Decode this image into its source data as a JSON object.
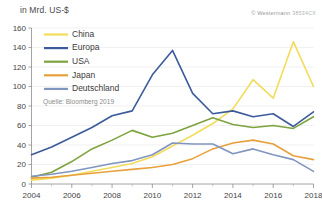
{
  "chart_data": {
    "type": "line",
    "title": "",
    "ylabel": "in Mrd. US-$",
    "xlabel": "",
    "unit_label": "in Mrd. US-$",
    "source": "Quelle: Bloomberg 2019",
    "copyright": "© Westermann",
    "copyright_code": "38534CX",
    "grid": true,
    "legend_position": "top-left",
    "ylim": [
      0,
      160
    ],
    "xlim": [
      2004,
      2018
    ],
    "yticks": [
      0,
      20,
      40,
      60,
      80,
      100,
      120,
      140,
      160
    ],
    "ytick_labels": [
      "0",
      "20",
      "40",
      "60",
      "80",
      "100",
      "120",
      "140",
      "160"
    ],
    "xticks": [
      2004,
      2006,
      2008,
      2010,
      2012,
      2014,
      2016,
      2018
    ],
    "xtick_labels": [
      "2004",
      "2006",
      "2008",
      "2010",
      "2012",
      "2014",
      "2016",
      "2018"
    ],
    "x_minor_ticks": [
      2005,
      2007,
      2009,
      2011,
      2013,
      2015,
      2017
    ],
    "x": [
      2004,
      2005,
      2006,
      2007,
      2008,
      2009,
      2010,
      2011,
      2012,
      2013,
      2014,
      2015,
      2016,
      2017,
      2018
    ],
    "series": [
      {
        "name": "China",
        "color": "#F2DC5A",
        "values": [
          4,
          6,
          9,
          13,
          17,
          21,
          28,
          39,
          50,
          62,
          77,
          107,
          88,
          146,
          100
        ]
      },
      {
        "name": "Europa",
        "color": "#3C5B9B",
        "values": [
          30,
          38,
          48,
          58,
          70,
          75,
          112,
          137,
          93,
          72,
          75,
          69,
          72,
          59,
          74
        ]
      },
      {
        "name": "USA",
        "color": "#7DA33E",
        "values": [
          7,
          12,
          23,
          36,
          45,
          55,
          48,
          52,
          60,
          68,
          61,
          58,
          60,
          57,
          69
        ]
      },
      {
        "name": "Japan",
        "color": "#E8A03C",
        "values": [
          6,
          7,
          9,
          11,
          13,
          15,
          17,
          20,
          26,
          36,
          42,
          45,
          41,
          29,
          25
        ]
      },
      {
        "name": "Deutschland",
        "color": "#8095BE",
        "values": [
          8,
          10,
          13,
          17,
          21,
          24,
          30,
          42,
          41,
          41,
          31,
          36,
          30,
          25,
          13
        ]
      }
    ]
  },
  "legend": {
    "items": [
      {
        "label": "China"
      },
      {
        "label": "Europa"
      },
      {
        "label": "USA"
      },
      {
        "label": "Japan"
      },
      {
        "label": "Deutschland"
      }
    ]
  }
}
